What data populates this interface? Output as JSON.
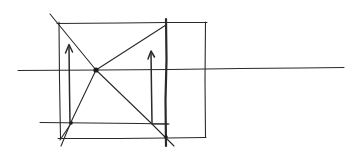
{
  "diagram": {
    "title": "",
    "ink_color": "#2a2a2a",
    "background_color": "#ffffff",
    "elements": [
      {
        "id": "horizon-line",
        "type": "line",
        "label": ""
      },
      {
        "id": "outer-square",
        "type": "rect",
        "label": ""
      },
      {
        "id": "diagonal-main",
        "type": "line",
        "label": ""
      },
      {
        "id": "diagonal-secondary",
        "type": "polyline",
        "label": ""
      },
      {
        "id": "inner-vertical-right",
        "type": "line",
        "label": ""
      },
      {
        "id": "inner-bottom-line",
        "type": "line",
        "label": ""
      },
      {
        "id": "center-point",
        "type": "dot",
        "label": ""
      },
      {
        "id": "arrow-left",
        "type": "arrow",
        "direction": "up",
        "label": ""
      },
      {
        "id": "arrow-right",
        "type": "arrow",
        "direction": "up",
        "label": ""
      }
    ],
    "text_labels": []
  }
}
